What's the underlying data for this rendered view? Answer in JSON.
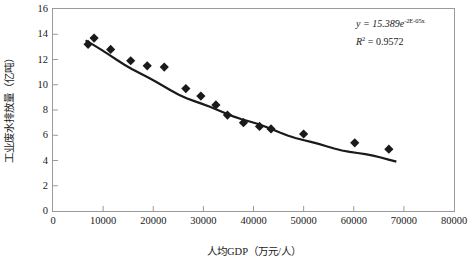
{
  "chart_data": {
    "type": "scatter",
    "title": "",
    "xlabel": "人均GDP（万元/人）",
    "ylabel": "工业废水排放量（亿吨）",
    "xlim": [
      0,
      80000
    ],
    "ylim": [
      0,
      16
    ],
    "xticks": [
      0,
      10000,
      20000,
      30000,
      40000,
      50000,
      60000,
      70000,
      80000
    ],
    "xtick_labels": [
      "0",
      "10000",
      "20000",
      "30000",
      "40000",
      "50000",
      "60000",
      "70000",
      "80000"
    ],
    "yticks": [
      0,
      2,
      4,
      6,
      8,
      10,
      12,
      14,
      16
    ],
    "ytick_labels": [
      "0",
      "2",
      "4",
      "6",
      "8",
      "10",
      "12",
      "14",
      "16"
    ],
    "grid": false,
    "legend": false,
    "marker": "diamond",
    "marker_color": "#1a1a1a",
    "line_color": "#1a1a1a",
    "points": [
      {
        "x": 7000,
        "y": 13.2
      },
      {
        "x": 8200,
        "y": 13.7
      },
      {
        "x": 11500,
        "y": 12.8
      },
      {
        "x": 15500,
        "y": 11.9
      },
      {
        "x": 18800,
        "y": 11.5
      },
      {
        "x": 22200,
        "y": 11.4
      },
      {
        "x": 26500,
        "y": 9.7
      },
      {
        "x": 29500,
        "y": 9.1
      },
      {
        "x": 32500,
        "y": 8.4
      },
      {
        "x": 34800,
        "y": 7.6
      },
      {
        "x": 38000,
        "y": 7.0
      },
      {
        "x": 41200,
        "y": 6.7
      },
      {
        "x": 43500,
        "y": 6.5
      },
      {
        "x": 50000,
        "y": 6.1
      },
      {
        "x": 60200,
        "y": 5.4
      },
      {
        "x": 67000,
        "y": 4.9
      }
    ],
    "trendline": {
      "type": "exponential",
      "equation_label": "y = 15.389e",
      "equation_exponent": "-2E-05x",
      "r2_label": "R",
      "r2_sup": "2",
      "r2_value": "= 0.9572",
      "coefficient": 15.389,
      "rate": -2e-05,
      "r_squared": 0.9572
    }
  }
}
